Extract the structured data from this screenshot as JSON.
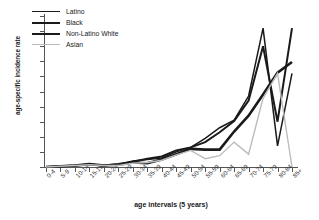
{
  "figure": {
    "partial_title": ""
  },
  "chart_data": {
    "type": "line",
    "title": "",
    "xlabel": "age intervals (5 years)",
    "ylabel": "age-specific incidence rate",
    "grid": false,
    "legend_position": "top-left-inside",
    "ylim": [
      0,
      10
    ],
    "yticks": [
      0,
      1,
      2,
      3,
      4,
      5,
      6,
      7,
      8,
      9,
      10
    ],
    "categories": [
      "0-4",
      "5-9",
      "10-14",
      "15-19",
      "20-24",
      "25-29",
      "30-34",
      "35-39",
      "40-44",
      "45-49",
      "50-54",
      "55-59",
      "60-64",
      "65-69",
      "70-74",
      "75-79",
      "80-84",
      "85+"
    ],
    "series": [
      {
        "name": "Latino",
        "color": "#1a1a1a",
        "width": 1.5,
        "values": [
          0.0,
          0.05,
          0.1,
          0.2,
          0.1,
          0.15,
          0.4,
          0.5,
          0.6,
          1.0,
          1.3,
          1.9,
          2.6,
          3.1,
          4.7,
          9.2,
          1.4,
          6.2
        ]
      },
      {
        "name": "Black",
        "color": "#1a1a1a",
        "width": 2.0,
        "values": [
          0.0,
          0.05,
          0.1,
          0.15,
          0.1,
          0.2,
          0.35,
          0.55,
          0.7,
          1.1,
          1.3,
          1.65,
          2.3,
          3.05,
          4.4,
          8.0,
          3.0,
          9.2
        ]
      },
      {
        "name": "Non-Latino White",
        "color": "#1a1a1a",
        "width": 2.6,
        "values": [
          0.0,
          0.05,
          0.1,
          0.2,
          0.1,
          0.15,
          0.3,
          0.25,
          0.5,
          0.85,
          1.2,
          1.15,
          1.15,
          2.35,
          3.4,
          4.8,
          6.25,
          6.95
        ]
      },
      {
        "name": "Asian",
        "color": "#bcbcbc",
        "width": 1.4,
        "values": [
          0.0,
          0.05,
          0.1,
          0.15,
          0.1,
          0.1,
          0.25,
          0.3,
          0.45,
          0.8,
          1.1,
          0.55,
          0.75,
          1.65,
          0.85,
          4.55,
          6.2,
          0.0
        ]
      }
    ]
  },
  "legend": {
    "items": [
      {
        "label": "Latino"
      },
      {
        "label": "Black"
      },
      {
        "label": "Non-Latino White"
      },
      {
        "label": "Asian"
      }
    ]
  }
}
